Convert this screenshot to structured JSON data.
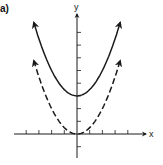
{
  "panel_label": "a)",
  "colors": {
    "ink": "#1a1a1a",
    "background": "#ffffff"
  },
  "chart_data": {
    "type": "line",
    "title": "",
    "panel": "a)",
    "xlabel": "x",
    "ylabel": "y",
    "xlim": [
      -5,
      5
    ],
    "ylim": [
      -1,
      8
    ],
    "grid": false,
    "x_ticks": [
      -4,
      -3,
      -2,
      -1,
      1,
      2,
      3,
      4
    ],
    "y_ticks": [
      -1,
      1,
      2,
      3,
      4,
      5,
      6,
      7,
      8
    ],
    "tick_labels_shown": false,
    "series": [
      {
        "name": "solid parabola",
        "style": "solid",
        "equation": "y = 0.5x^2 + 3",
        "vertex": [
          0,
          3
        ],
        "arrows_at_ends": true,
        "x": [
          -3.4,
          -3,
          -2,
          -1,
          0,
          1,
          2,
          3,
          3.4
        ],
        "y": [
          8.78,
          7.5,
          5,
          3.5,
          3,
          3.5,
          5,
          7.5,
          8.78
        ]
      },
      {
        "name": "dashed parabola",
        "style": "dashed",
        "equation": "y = 0.5x^2",
        "vertex": [
          0,
          0
        ],
        "arrows_at_ends": true,
        "x": [
          -3.4,
          -3,
          -2,
          -1,
          0,
          1,
          2,
          3,
          3.4
        ],
        "y": [
          5.78,
          4.5,
          2,
          0.5,
          0,
          0.5,
          2,
          4.5,
          5.78
        ]
      }
    ],
    "legend": null
  }
}
